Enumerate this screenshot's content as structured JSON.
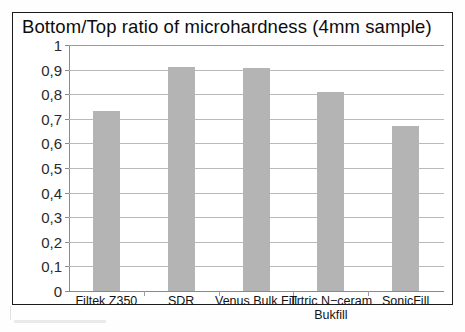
{
  "chart_data": {
    "type": "bar",
    "title": "Bottom/Top ratio of microhardness (4mm sample)",
    "xlabel": "",
    "ylabel": "",
    "categories": [
      "Filtek Z350",
      "SDR",
      "Venus Bulk Fill",
      "Trtric N−ceram Bukfill",
      "SonicFill"
    ],
    "category_lines": [
      [
        "Filtek Z350"
      ],
      [
        "SDR"
      ],
      [
        "Venus Bulk Fill"
      ],
      [
        "Trtric N−ceram",
        "Bukfill"
      ],
      [
        "SonicFill"
      ]
    ],
    "values": [
      0.73,
      0.91,
      0.905,
      0.81,
      0.67
    ],
    "ylim": [
      0,
      1
    ],
    "ytick_labels": [
      "1",
      "0,9",
      "0,8",
      "0,7",
      "0,6",
      "0,5",
      "0,4",
      "0,3",
      "0,2",
      "0,1",
      "0"
    ],
    "ytick_values": [
      1,
      0.9,
      0.8,
      0.7,
      0.6,
      0.5,
      0.4,
      0.3,
      0.2,
      0.1,
      0
    ],
    "grid": true,
    "legend": false,
    "series": [
      {
        "name": "Bottom/Top ratio",
        "values": [
          0.73,
          0.91,
          0.905,
          0.81,
          0.67
        ]
      }
    ],
    "colors": {
      "bar": "#b4b4b4",
      "gridline": "#b9b9b9",
      "axis": "#8a8a8a",
      "frame": "#1b1b1b",
      "text": "#141414",
      "background": "#ffffff"
    }
  }
}
